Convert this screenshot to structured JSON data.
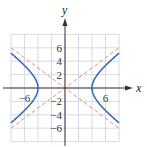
{
  "chart_data": {
    "type": "line",
    "title": "",
    "xlabel": "x",
    "ylabel": "y",
    "xlim": [
      -8,
      8
    ],
    "ylim": [
      -8,
      8
    ],
    "grid": true,
    "grid_step": 2,
    "x_tick_labels": [
      {
        "value": -6,
        "label": "−6"
      },
      {
        "value": 6,
        "label": "6"
      }
    ],
    "y_tick_labels": [
      {
        "value": 6,
        "label": "6"
      },
      {
        "value": 4,
        "label": "4"
      },
      {
        "value": 2,
        "label": "2"
      },
      {
        "value": -2,
        "label": "−2"
      },
      {
        "value": -4,
        "label": "−4"
      },
      {
        "value": -6,
        "label": "−6"
      }
    ],
    "series": [
      {
        "name": "hyperbola",
        "equation": "x^2/16 - y^2/9 = 1",
        "style": "solid",
        "color": "#3a6db3",
        "vertices": [
          [
            -4,
            0
          ],
          [
            4,
            0
          ]
        ],
        "x_range": [
          -8,
          8
        ]
      },
      {
        "name": "asymptote-positive",
        "equation": "y = (3/4)x",
        "style": "dashed",
        "color": "#e48a8a",
        "points": [
          [
            -8,
            -6
          ],
          [
            8,
            6
          ]
        ]
      },
      {
        "name": "asymptote-negative",
        "equation": "y = -(3/4)x",
        "style": "dashed",
        "color": "#e48a8a",
        "points": [
          [
            -8,
            6
          ],
          [
            8,
            -6
          ]
        ]
      }
    ],
    "colors": {
      "grid": "#c9d3de",
      "axis": "#333333",
      "curve": "#3a6db3",
      "asymptote": "#e48a8a"
    }
  }
}
